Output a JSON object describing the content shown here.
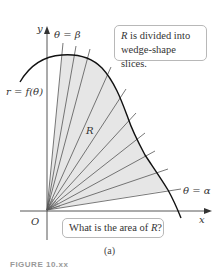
{
  "figure": {
    "subcaption": "(a)",
    "figure_number_partial": "FIGURE 10.xx"
  },
  "labels": {
    "y_axis": "y",
    "x_axis": "x",
    "origin": "O",
    "theta_beta": "θ = β",
    "theta_alpha": "θ = α",
    "curve": "r = f(θ)",
    "region": "R"
  },
  "callouts": {
    "top": {
      "italic": "R",
      "line1_rest": " is divided into",
      "line2": "wedge-shape slices."
    },
    "bottom": {
      "prefix": "What is the area of ",
      "italic": "R",
      "suffix": "?"
    }
  },
  "colors": {
    "region_fill": "#e6e6e6",
    "lines": "#444444",
    "curve": "#111111",
    "text": "#333333",
    "box_border": "#b8b8b8"
  },
  "geometry": {
    "origin": [
      47,
      210
    ],
    "ray_count": 11,
    "ray_endpoints": [
      [
        63,
        43
      ],
      [
        90,
        49
      ],
      [
        111,
        67
      ],
      [
        126,
        89
      ],
      [
        136,
        113
      ],
      [
        145,
        133
      ],
      [
        155,
        151
      ],
      [
        168,
        169
      ],
      [
        181,
        189
      ]
    ]
  }
}
